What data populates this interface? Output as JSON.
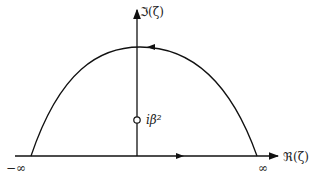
{
  "diagram": {
    "type": "complex-plane contour",
    "labels": {
      "imag_axis": "ℑ(ζ)",
      "real_axis": "ℜ(ζ)",
      "minus_infinity": "−∞",
      "plus_infinity": "∞",
      "pole": "iβ²"
    },
    "colors": {
      "stroke": "#111111",
      "background": "#ffffff"
    }
  }
}
